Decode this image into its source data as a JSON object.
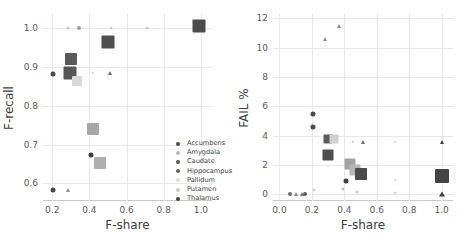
{
  "figure": {
    "background": "#ffffff",
    "grid_color": "#e9e9e9",
    "text_color": "#3b3b3b"
  },
  "structures": [
    {
      "name": "Accumbens",
      "color": "#4a4a4a",
      "marker": "circle"
    },
    {
      "name": "Amygdala",
      "color": "#b9b9b9",
      "marker": "circle"
    },
    {
      "name": "Caudate",
      "color": "#555555",
      "marker": "circle"
    },
    {
      "name": "Hippocampus",
      "color": "#5f5f5f",
      "marker": "circle"
    },
    {
      "name": "Pallidum",
      "color": "#dcdcdc",
      "marker": "circle"
    },
    {
      "name": "Putamen",
      "color": "#c6c6c6",
      "marker": "circle"
    },
    {
      "name": "Thalamus",
      "color": "#3f3f3f",
      "marker": "circle"
    }
  ],
  "chart_data": [
    {
      "id": "left",
      "type": "scatter",
      "title": "",
      "xlabel": "F-share",
      "ylabel": "F-recall",
      "xlim": [
        0.15,
        1.06
      ],
      "ylim": [
        0.555,
        1.035
      ],
      "xticks": [
        "0.2",
        "0.4",
        "0.6",
        "0.8",
        "1.0"
      ],
      "xtick_values": [
        0.2,
        0.4,
        0.6,
        0.8,
        1.0
      ],
      "yticks": [
        "0.6",
        "0.7",
        "0.8",
        "0.9",
        "1.0"
      ],
      "ytick_values": [
        0.6,
        0.7,
        0.8,
        0.9,
        1.0
      ],
      "grid": true,
      "legend_position": "lower right",
      "points": [
        {
          "series": "Amygdala",
          "x": 0.285,
          "y": 1.0,
          "size": 3,
          "marker": "circle",
          "color": "#c9c9c9"
        },
        {
          "series": "Pallidum",
          "x": 0.345,
          "y": 1.0,
          "size": 4,
          "marker": "circle",
          "color": "#9e9e9e"
        },
        {
          "series": "Putamen",
          "x": 0.515,
          "y": 1.0,
          "size": 3,
          "marker": "circle",
          "color": "#cfcfcf"
        },
        {
          "series": "Amygdala",
          "x": 0.71,
          "y": 1.0,
          "size": 3,
          "marker": "circle",
          "color": "#cccccc"
        },
        {
          "series": "Thalamus",
          "x": 0.99,
          "y": 1.003,
          "size": 13,
          "marker": "square",
          "color": "#4b4b4b"
        },
        {
          "series": "Caudate",
          "x": 0.5,
          "y": 0.963,
          "size": 13,
          "marker": "square",
          "color": "#4f4f4f"
        },
        {
          "series": "Hippocampus",
          "x": 0.303,
          "y": 0.92,
          "size": 12,
          "marker": "square",
          "color": "#595959"
        },
        {
          "series": "Accumbens",
          "x": 0.205,
          "y": 0.882,
          "size": 5,
          "marker": "circle",
          "color": "#4a4a4a"
        },
        {
          "series": "Caudate",
          "x": 0.293,
          "y": 0.883,
          "size": 13,
          "marker": "square",
          "color": "#565656"
        },
        {
          "series": "Pallidum",
          "x": 0.333,
          "y": 0.862,
          "size": 10,
          "marker": "square",
          "color": "#d8d8d8"
        },
        {
          "series": "Putamen",
          "x": 0.418,
          "y": 0.883,
          "size": 2,
          "marker": "circle",
          "color": "#cfcfcf"
        },
        {
          "series": "Hippocampus",
          "x": 0.513,
          "y": 0.883,
          "size": 4,
          "marker": "triangle",
          "color": "#6b6b6b"
        },
        {
          "series": "Putamen",
          "x": 0.42,
          "y": 0.741,
          "size": 12,
          "marker": "square",
          "color": "#a7a7a7"
        },
        {
          "series": "Thalamus",
          "x": 0.408,
          "y": 0.673,
          "size": 5,
          "marker": "circle",
          "color": "#3f3f3f"
        },
        {
          "series": "Putamen",
          "x": 0.455,
          "y": 0.652,
          "size": 12,
          "marker": "square",
          "color": "#b0b0b0"
        },
        {
          "series": "Accumbens",
          "x": 0.205,
          "y": 0.582,
          "size": 5,
          "marker": "circle",
          "color": "#4a4a4a"
        },
        {
          "series": "Amygdala",
          "x": 0.282,
          "y": 0.582,
          "size": 4,
          "marker": "triangle",
          "color": "#8f8f8f"
        }
      ]
    },
    {
      "id": "right",
      "type": "scatter",
      "title": "",
      "xlabel": "F-share",
      "ylabel": "FAIL %",
      "xlim": [
        -0.04,
        1.07
      ],
      "ylim": [
        -0.45,
        12.3
      ],
      "xticks": [
        "0.0",
        "0.2",
        "0.4",
        "0.6",
        "0.8",
        "1.0"
      ],
      "xtick_values": [
        0.0,
        0.2,
        0.4,
        0.6,
        0.8,
        1.0
      ],
      "yticks": [
        "0",
        "2",
        "4",
        "6",
        "8",
        "10",
        "12"
      ],
      "ytick_values": [
        0,
        2,
        4,
        6,
        8,
        10,
        12
      ],
      "grid": true,
      "legend_position": "upper right",
      "points": [
        {
          "series": "Amygdala",
          "x": 0.37,
          "y": 11.48,
          "size": 4,
          "marker": "triangle",
          "color": "#8a8a8a"
        },
        {
          "series": "Amygdala",
          "x": 0.28,
          "y": 10.6,
          "size": 4,
          "marker": "triangle",
          "color": "#8a8a8a"
        },
        {
          "series": "Accumbens",
          "x": 0.205,
          "y": 5.45,
          "size": 5,
          "marker": "circle",
          "color": "#4a4a4a"
        },
        {
          "series": "Accumbens",
          "x": 0.205,
          "y": 4.58,
          "size": 5,
          "marker": "circle",
          "color": "#4a4a4a"
        },
        {
          "series": "Hippocampus",
          "x": 0.3,
          "y": 3.8,
          "size": 9,
          "marker": "square",
          "color": "#5c5c5c"
        },
        {
          "series": "Pallidum",
          "x": 0.338,
          "y": 3.75,
          "size": 9,
          "marker": "square",
          "color": "#cfcfcf"
        },
        {
          "series": "Putamen",
          "x": 0.452,
          "y": 3.58,
          "size": 2,
          "marker": "circle",
          "color": "#c4c4c4"
        },
        {
          "series": "Hippocampus",
          "x": 0.515,
          "y": 3.56,
          "size": 4,
          "marker": "triangle",
          "color": "#6f6f6f"
        },
        {
          "series": "Putamen",
          "x": 0.712,
          "y": 3.56,
          "size": 2,
          "marker": "circle",
          "color": "#d3d3d3"
        },
        {
          "series": "Thalamus",
          "x": 1.0,
          "y": 3.58,
          "size": 4,
          "marker": "triangle",
          "color": "#3f3f3f"
        },
        {
          "series": "Caudate",
          "x": 0.297,
          "y": 2.7,
          "size": 11,
          "marker": "square",
          "color": "#4f4f4f"
        },
        {
          "series": "Putamen",
          "x": 0.432,
          "y": 2.08,
          "size": 11,
          "marker": "square",
          "color": "#a3a3a3"
        },
        {
          "series": "Putamen",
          "x": 0.468,
          "y": 1.68,
          "size": 11,
          "marker": "square",
          "color": "#b5b5b5"
        },
        {
          "series": "Caudate",
          "x": 0.5,
          "y": 1.36,
          "size": 12,
          "marker": "square",
          "color": "#4a4a4a"
        },
        {
          "series": "Thalamus",
          "x": 1.0,
          "y": 1.25,
          "size": 14,
          "marker": "square",
          "color": "#444444"
        },
        {
          "series": "Thalamus",
          "x": 0.412,
          "y": 0.92,
          "size": 5,
          "marker": "circle",
          "color": "#3f3f3f"
        },
        {
          "series": "Putamen",
          "x": 0.712,
          "y": 0.95,
          "size": 2,
          "marker": "circle",
          "color": "#cdcdcd"
        },
        {
          "series": "Putamen",
          "x": 0.39,
          "y": 0.4,
          "size": 3,
          "marker": "circle",
          "color": "#c4c4c4"
        },
        {
          "series": "Pallidum",
          "x": 0.215,
          "y": 0.33,
          "size": 3,
          "marker": "circle",
          "color": "#d6d6d6"
        },
        {
          "series": "Putamen",
          "x": 0.48,
          "y": 0.14,
          "size": 3,
          "marker": "circle",
          "color": "#c9c9c9"
        },
        {
          "series": "Pallidum",
          "x": 0.712,
          "y": 0.12,
          "size": 3,
          "marker": "circle",
          "color": "#d6d6d6"
        },
        {
          "series": "Accumbens",
          "x": 0.062,
          "y": 0.05,
          "size": 4,
          "marker": "circle",
          "color": "#6a6a6a"
        },
        {
          "series": "Amygdala",
          "x": 0.1,
          "y": 0.04,
          "size": 4,
          "marker": "triangle",
          "color": "#8a8a8a"
        },
        {
          "series": "Caudate",
          "x": 0.14,
          "y": 0.04,
          "size": 4,
          "marker": "triangle",
          "color": "#7a7a7a"
        },
        {
          "series": "Hippocampus",
          "x": 0.155,
          "y": 0.04,
          "size": 4,
          "marker": "circle",
          "color": "#5c5c5c"
        },
        {
          "series": "Thalamus",
          "x": 1.0,
          "y": 0.06,
          "size": 5,
          "marker": "triangle",
          "color": "#3f3f3f"
        }
      ]
    }
  ]
}
